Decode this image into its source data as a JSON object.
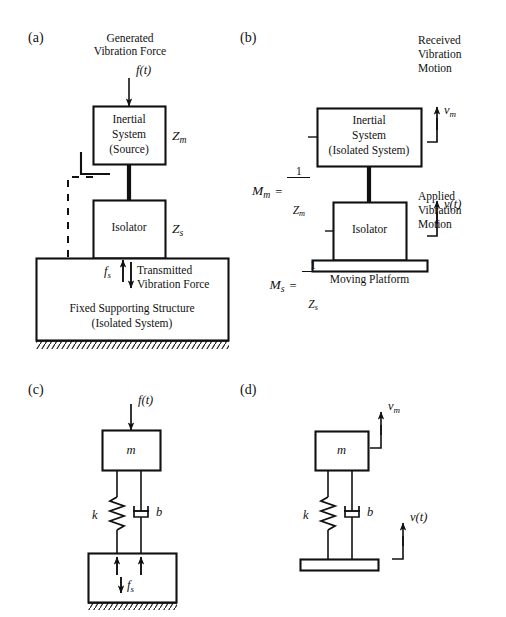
{
  "figure": {
    "background": "#ffffff",
    "ink": "#111111",
    "panels": [
      {
        "tag": "(a)",
        "title_force_top": [
          "Generated",
          "Vibration Force"
        ],
        "force_symbol": "f(t)",
        "boxes": [
          {
            "name": "inertial-system",
            "lines": [
              "Inertial",
              "System",
              "(Source)"
            ],
            "impedance": "Z",
            "impedance_sub": "m"
          },
          {
            "name": "isolator",
            "lines": [
              "Isolator"
            ],
            "impedance": "Z",
            "impedance_sub": "s"
          },
          {
            "name": "fixed-supporting-structure",
            "lines": [
              "Fixed Supporting Structure",
              "(Isolated System)"
            ]
          }
        ],
        "transmitted_symbol": "f",
        "transmitted_sub": "s",
        "transmitted_label": [
          "Transmitted",
          "Vibration Force"
        ]
      },
      {
        "tag": "(b)",
        "received_label": [
          "Received",
          "Vibration",
          "Motion"
        ],
        "received_symbol": "v",
        "received_sub": "m",
        "applied_label": [
          "Applied",
          "Vibration",
          "Motion"
        ],
        "applied_symbol": "v(t)",
        "mobility_m": {
          "lhs": "M",
          "lhs_sub": "m",
          "eq": "=",
          "num": "1",
          "den": "Z",
          "den_sub": "m"
        },
        "mobility_s": {
          "lhs": "M",
          "lhs_sub": "s",
          "eq": "=",
          "num": "1",
          "den": "Z",
          "den_sub": "s"
        },
        "boxes": [
          {
            "name": "inertial-system",
            "lines": [
              "Inertial",
              "System",
              "(Isolated System)"
            ]
          },
          {
            "name": "isolator",
            "lines": [
              "Isolator"
            ]
          },
          {
            "name": "moving-platform",
            "lines": []
          }
        ],
        "platform_label": "Moving Platform"
      },
      {
        "tag": "(c)",
        "force_symbol": "f(t)",
        "mass_symbol": "m",
        "spring_symbol": "k",
        "damper_symbol": "b",
        "reaction_symbol": "f",
        "reaction_sub": "s"
      },
      {
        "tag": "(d)",
        "mass_symbol": "m",
        "spring_symbol": "k",
        "damper_symbol": "b",
        "top_velocity": "v",
        "top_velocity_sub": "m",
        "base_velocity": "v(t)"
      }
    ]
  }
}
